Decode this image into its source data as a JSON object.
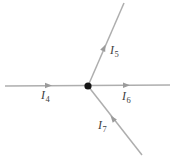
{
  "diagram": {
    "labels": {
      "i4": {
        "symbol": "I",
        "subscript": "4"
      },
      "i5": {
        "symbol": "I",
        "subscript": "5"
      },
      "i6": {
        "symbol": "I",
        "subscript": "6"
      },
      "i7": {
        "symbol": "I",
        "subscript": "7"
      }
    }
  },
  "colors": {
    "background": "#ffffff",
    "wire": "#aeaeae",
    "arrow": "#9b9b9b",
    "node": "#161616",
    "label": "#3d3d3d"
  }
}
